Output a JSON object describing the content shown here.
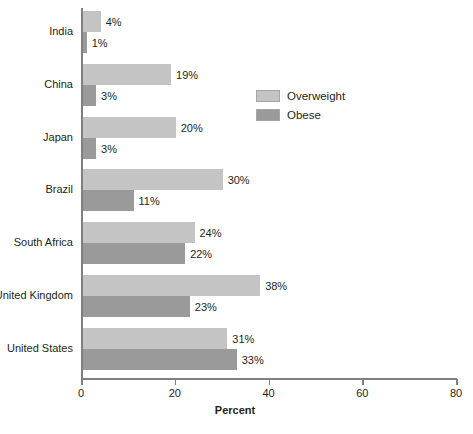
{
  "chart_data": {
    "type": "bar",
    "orientation": "horizontal",
    "title": "",
    "xlabel": "Percent",
    "ylabel": "",
    "xlim": [
      0,
      80
    ],
    "xticks": [
      0,
      20,
      40,
      60,
      80
    ],
    "xtick_labels": [
      "0",
      "20",
      "40",
      "60",
      "80"
    ],
    "grid": false,
    "legend_position": "upper right",
    "value_suffix": "%",
    "categories": [
      "India",
      "China",
      "Japan",
      "Brazil",
      "South Africa",
      "United Kingdom",
      "United States"
    ],
    "series": [
      {
        "name": "Overweight",
        "color": "#c4c4c4",
        "values": [
          4,
          19,
          20,
          30,
          24,
          38,
          31
        ],
        "labels": [
          "4%",
          "19%",
          "20%",
          "30%",
          "24%",
          "38%",
          "31%"
        ]
      },
      {
        "name": "Obese",
        "color": "#9a9a9a",
        "values": [
          1,
          3,
          3,
          11,
          22,
          23,
          33
        ],
        "labels": [
          "1%",
          "3%",
          "3%",
          "11%",
          "22%",
          "23%",
          "33%"
        ]
      }
    ]
  },
  "legend": {
    "items": [
      {
        "label": "Overweight",
        "color": "#c4c4c4"
      },
      {
        "label": "Obese",
        "color": "#9a9a9a"
      }
    ]
  },
  "axis": {
    "x_title": "Percent",
    "tick_labels": [
      "0",
      "20",
      "40",
      "60",
      "80"
    ]
  }
}
